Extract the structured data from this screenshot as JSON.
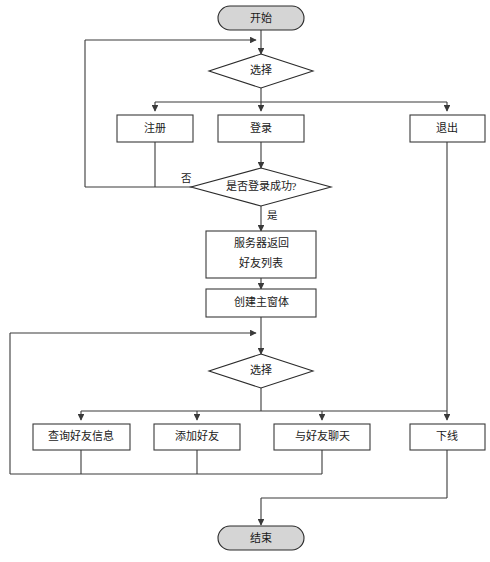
{
  "diagram": {
    "language": "zh-CN",
    "type": "flowchart",
    "colors": {
      "terminal_fill": "#d5d5d5",
      "process_fill": "#ffffff",
      "stroke": "#3a3a3a",
      "text": "#1a1a1a",
      "background": "#ffffff"
    },
    "nodes": {
      "start": {
        "label": "开始",
        "shape": "terminal"
      },
      "choice_top": {
        "label": "选择",
        "shape": "decision"
      },
      "register": {
        "label": "注册",
        "shape": "process"
      },
      "login": {
        "label": "登录",
        "shape": "process"
      },
      "quit": {
        "label": "退出",
        "shape": "process"
      },
      "login_check": {
        "label": "是否登录成功?",
        "shape": "decision"
      },
      "server_return_line1": {
        "label": "服务器返回",
        "shape": "process"
      },
      "server_return_line2": {
        "label": "好友列表",
        "shape": "process"
      },
      "create_main_window": {
        "label": "创建主窗体",
        "shape": "process"
      },
      "choice_main": {
        "label": "选择",
        "shape": "decision"
      },
      "query_friend_info": {
        "label": "查询好友信息",
        "shape": "process"
      },
      "add_friend": {
        "label": "添加好友",
        "shape": "process"
      },
      "chat_with_friend": {
        "label": "与好友聊天",
        "shape": "process"
      },
      "offline": {
        "label": "下线",
        "shape": "process"
      },
      "end": {
        "label": "结束",
        "shape": "terminal"
      }
    },
    "edge_labels": {
      "login_check_no": "否",
      "login_check_yes": "是"
    }
  }
}
